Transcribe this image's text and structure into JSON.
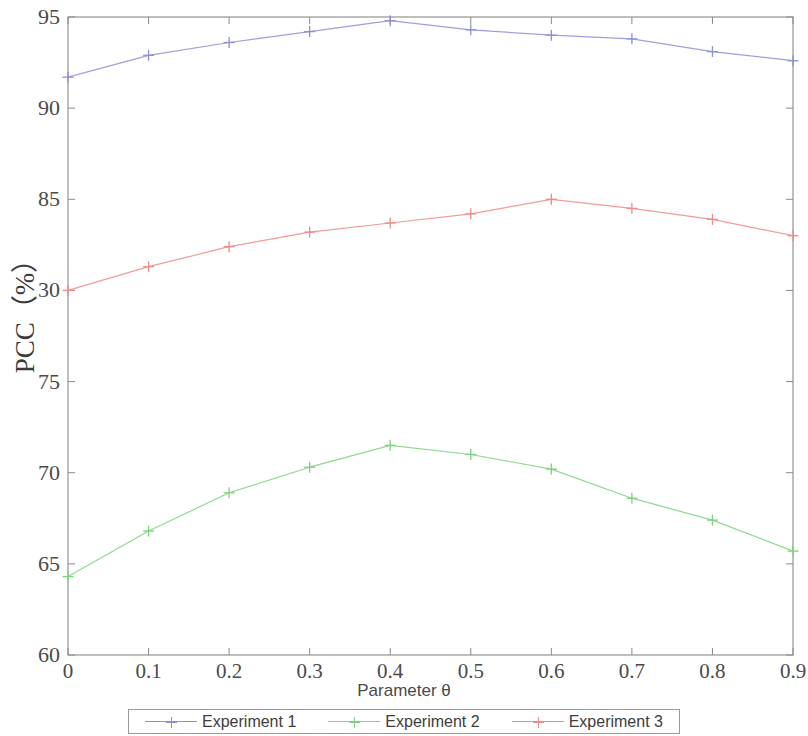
{
  "chart_data": {
    "type": "line",
    "title": "",
    "xlabel": "Parameter θ",
    "ylabel": "PCC（%）",
    "x": [
      0,
      0.1,
      0.2,
      0.3,
      0.4,
      0.5,
      0.6,
      0.7,
      0.8,
      0.9
    ],
    "xtick_labels": [
      "0",
      "0.1",
      "0.2",
      "0.3",
      "0.4",
      "0.5",
      "0.6",
      "0.7",
      "0.8",
      "0.9"
    ],
    "ytick_labels": [
      "95",
      "90",
      "85",
      "30",
      "75",
      "70",
      "65",
      "60"
    ],
    "ytick_values": [
      95,
      90,
      85,
      80,
      75,
      70,
      65,
      60
    ],
    "xlim": [
      0,
      0.9
    ],
    "ylim": [
      60,
      95
    ],
    "grid": false,
    "legend_position": "bottom-outside",
    "marker": "plus",
    "series": [
      {
        "name": "Experiment 1",
        "color": "#8e8ed6",
        "values": [
          91.7,
          92.9,
          93.6,
          94.2,
          94.8,
          94.3,
          94.0,
          93.8,
          93.1,
          92.6
        ]
      },
      {
        "name": "Experiment 2",
        "color": "#7ed17e",
        "values": [
          64.3,
          66.8,
          68.9,
          70.3,
          71.5,
          71.0,
          70.2,
          68.6,
          67.4,
          65.7
        ]
      },
      {
        "name": "Experiment 3",
        "color": "#ef8a8a",
        "values": [
          80.0,
          81.3,
          82.4,
          83.2,
          83.7,
          84.2,
          85.0,
          84.5,
          83.9,
          83.0
        ]
      }
    ]
  },
  "legend": {
    "entries": [
      {
        "label": "Experiment 1"
      },
      {
        "label": "Experiment 2"
      },
      {
        "label": "Experiment 3"
      }
    ]
  },
  "axes": {
    "frame_color": "#8a8a8a"
  }
}
